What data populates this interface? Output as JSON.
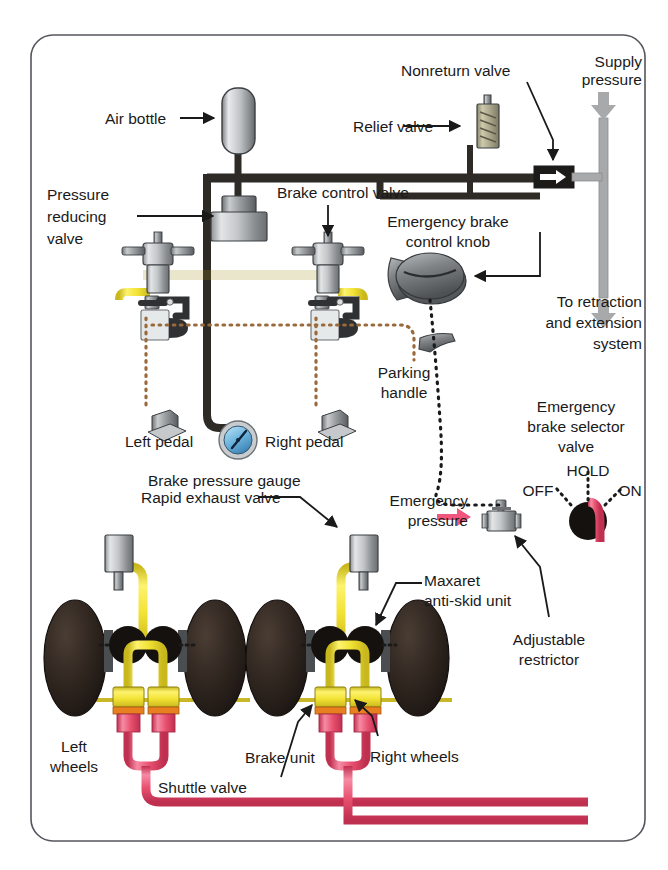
{
  "figure": {
    "frame": {
      "stroke": "#4a4a52",
      "fill": "#ffffff"
    }
  },
  "colors": {
    "supply_pipe": "#2e2a26",
    "brake_pipe_yellow": "#f2e234",
    "emergency_pipe_red": "#e8516f",
    "antiskid_dotted": "#9a6a3c",
    "knob_dotted": "#1a1a1a",
    "metal_light": "#d7d9da",
    "metal_dark": "#6d7174",
    "tyre": "#2a211c",
    "arrow_grey": "#a8a9ab",
    "arrow_pink": "#f0557d",
    "text": "#1a1a1a"
  },
  "labels": {
    "air_bottle": "Air bottle",
    "pressure_reducing_valve": [
      "Pressure",
      "reducing",
      "valve"
    ],
    "brake_control_valve": "Brake control valve",
    "nonreturn_valve": "Nonreturn valve",
    "relief_valve": "Relief valve",
    "supply_pressure": [
      "Supply",
      "pressure"
    ],
    "emergency_brake_control_knob": [
      "Emergency brake",
      "control knob"
    ],
    "to_retraction": [
      "To retraction",
      "and extension",
      "system"
    ],
    "parking_handle": [
      "Parking",
      "handle"
    ],
    "left_pedal": "Left pedal",
    "right_pedal": "Right pedal",
    "brake_pressure_gauge": "Brake pressure gauge",
    "rapid_exhaust_valve": "Rapid exhaust valve",
    "emergency_pressure": [
      "Emergency",
      "pressure"
    ],
    "emergency_brake_selector_valve": [
      "Emergency",
      "brake selector",
      "valve"
    ],
    "selector_positions": [
      "HOLD",
      "OFF",
      "ON"
    ],
    "maxaret_anti_skid_unit": [
      "Maxaret",
      "anti-skid unit"
    ],
    "adjustable_restrictor": [
      "Adjustable",
      "restrictor"
    ],
    "left_wheels": [
      "Left",
      "wheels"
    ],
    "right_wheels": "Right wheels",
    "brake_unit": "Brake unit",
    "shuttle_valve": "Shuttle valve"
  }
}
